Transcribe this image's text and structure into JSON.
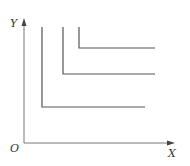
{
  "diagram": {
    "type": "indifference-curves",
    "axes": {
      "x_label": "X",
      "y_label": "Y",
      "origin_label": "O",
      "color": "#666666"
    },
    "curves": [
      {
        "name": "curve-1",
        "corner": [
          42,
          107
        ],
        "top": 27,
        "right": 145,
        "color": "#555555"
      },
      {
        "name": "curve-2",
        "corner": [
          63,
          74
        ],
        "top": 27,
        "right": 155,
        "color": "#555555"
      },
      {
        "name": "curve-3",
        "corner": [
          79,
          48
        ],
        "top": 27,
        "right": 155,
        "color": "#555555"
      }
    ]
  }
}
